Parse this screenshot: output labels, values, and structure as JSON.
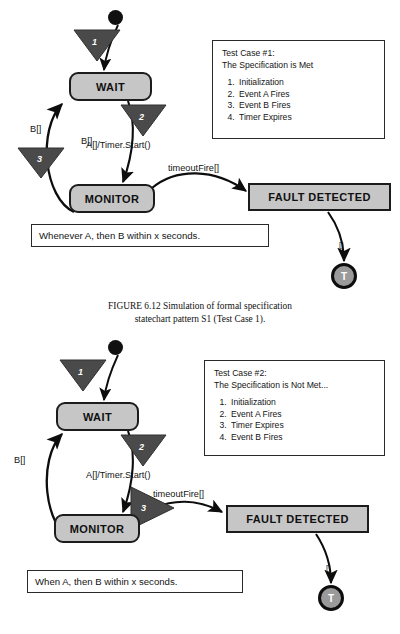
{
  "figure": {
    "caption_line1": "FIGURE 6.12   Simulation of formal specification",
    "caption_line2": "statechart pattern S1 (Test Case 1)."
  },
  "diagram1": {
    "name": "statechart-test-case-1",
    "states": {
      "wait": "WAIT",
      "monitor": "MONITOR",
      "fault": "FAULT DETECTED",
      "terminal": "T"
    },
    "transitions": {
      "t1_label": "",
      "t2_label": "A[]/Timer.Start()",
      "t3_label": "B[]",
      "timeout_label": "timeoutFire[]",
      "fault_exit_label": "[]"
    },
    "steps": {
      "one": "1",
      "two": "2",
      "three": "3"
    },
    "note": {
      "title": "Test Case #1:",
      "subtitle": "The Specification is Met",
      "items": [
        "Initialization",
        "Event A Fires",
        "Event B Fires",
        "Timer Expires"
      ]
    },
    "requirement": "Whenever A, then B within x seconds."
  },
  "diagram2": {
    "name": "statechart-test-case-2",
    "states": {
      "wait": "WAIT",
      "monitor": "MONITOR",
      "fault": "FAULT DETECTED",
      "terminal": "T"
    },
    "transitions": {
      "t1_label": "",
      "t2_label": "A[]/Timer.Start()",
      "t3_label": "B[]",
      "timeout_label": "timeoutFire[]",
      "fault_exit_label": "[]"
    },
    "steps": {
      "one": "1",
      "two": "2",
      "three": "3"
    },
    "note": {
      "title": "Test Case #2:",
      "subtitle": "The Specification is Not Met...",
      "items": [
        "Initialization",
        "Event A Fires",
        "Timer Expires",
        "Event B Fires"
      ]
    },
    "requirement": "When A, then B within x seconds."
  },
  "colors": {
    "state_fill": "#c6c6c6",
    "fault_fill": "#c6c6c6",
    "triangle_fill": "#4a4a4a",
    "outline": "#1c1c1c",
    "terminal_fill": "#9a9a9a",
    "background": "#ffffff"
  }
}
